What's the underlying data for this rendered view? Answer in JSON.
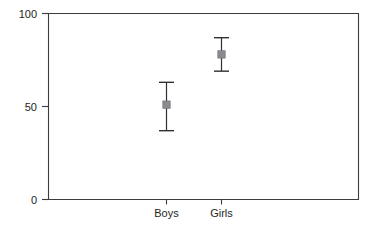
{
  "chart_data": {
    "type": "scatter",
    "title": "",
    "subtitle": "",
    "xlabel": "",
    "ylabel": "",
    "categories": [
      "Boys",
      "Girls"
    ],
    "ylim": [
      0,
      100
    ],
    "yticks": [
      0,
      50,
      100
    ],
    "ytick_labels": [
      "0",
      "50",
      "100"
    ],
    "grid": false,
    "legend": null,
    "legend_position": "none",
    "error_bars": true,
    "series": [
      {
        "name": "mean",
        "values": [
          51,
          78
        ],
        "error_low": [
          37,
          69
        ],
        "error_high": [
          63,
          87
        ]
      }
    ],
    "points": [
      {
        "category": "Boys",
        "value": 51,
        "lower": 37,
        "upper": 63
      },
      {
        "category": "Girls",
        "value": 78,
        "lower": 69,
        "upper": 87
      }
    ],
    "colors": {
      "marker": "#8a8a8f",
      "error_bar": "#2e2e33",
      "axis": "#3b3b42",
      "text": "#231f20",
      "background": "#ffffff"
    }
  },
  "axis": {
    "y_tick_top": "100",
    "y_tick_mid": "50",
    "y_tick_bottom": "0"
  },
  "categories": {
    "first": "Boys",
    "second": "Girls"
  }
}
